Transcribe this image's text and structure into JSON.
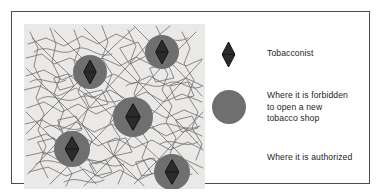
{
  "figure": {
    "map": {
      "name": "street-network-map",
      "background_color": "#ebe9e7",
      "line_color": "#6b6b6b",
      "sites": [
        {
          "id": "site-1",
          "cx": 66,
          "cy": 48,
          "r": 17,
          "marker": "diamond"
        },
        {
          "id": "site-2",
          "cx": 138,
          "cy": 28,
          "r": 17,
          "marker": "diamond"
        },
        {
          "id": "site-3",
          "cx": 109,
          "cy": 93,
          "r": 20,
          "marker": "diamond"
        },
        {
          "id": "site-4",
          "cx": 48,
          "cy": 125,
          "r": 18,
          "marker": "diamond"
        },
        {
          "id": "site-5",
          "cx": 148,
          "cy": 148,
          "r": 18,
          "marker": "diamond"
        }
      ]
    },
    "legend": {
      "items": [
        {
          "key": "tobacconist",
          "symbol": "diamond-marker",
          "label": "Tobacconist",
          "color": "#1d1d1d"
        },
        {
          "key": "forbidden-zone",
          "symbol": "gray-circle",
          "label": "Where it is forbidden\nto open a  new\ntobacco shop",
          "color": "#6f6f6f"
        },
        {
          "key": "authorized-zone",
          "symbol": "white-area",
          "label": "Where it is authorized",
          "color": "#ffffff"
        }
      ]
    }
  }
}
